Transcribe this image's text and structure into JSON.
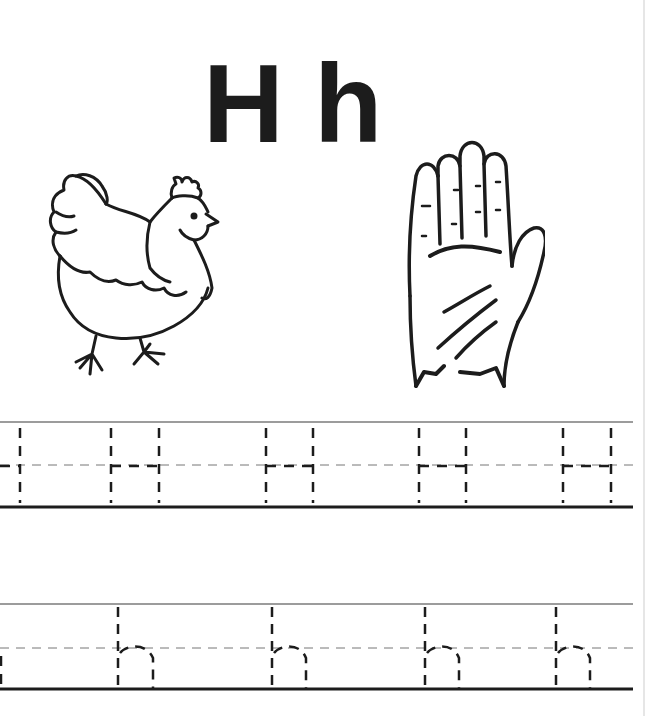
{
  "worksheet": {
    "letter_upper": "H",
    "letter_lower": "h",
    "pictures": [
      {
        "name": "hen",
        "description": "hen line drawing"
      },
      {
        "name": "hand",
        "description": "raised open hand line drawing"
      }
    ],
    "tracing_rows": [
      {
        "letter": "H",
        "count_full": 4,
        "count_partial": 1,
        "top_y": 422,
        "mid_y": 465,
        "base_y": 507,
        "traces": [
          [
            null,
            20
          ],
          [
            111,
            159
          ],
          [
            266,
            313
          ],
          [
            419,
            466
          ],
          [
            563,
            611
          ]
        ]
      },
      {
        "letter": "h",
        "count_full": 4,
        "count_partial": 1,
        "top_y": 604,
        "mid_y": 648,
        "base_y": 689,
        "traces": [
          [
            null,
            0
          ],
          [
            118,
            153
          ],
          [
            272,
            306
          ],
          [
            425,
            459
          ],
          [
            556,
            590
          ]
        ]
      }
    ]
  },
  "colors": {
    "ink": "#1c1c1c",
    "guide": "#555555",
    "paper": "#ffffff"
  }
}
